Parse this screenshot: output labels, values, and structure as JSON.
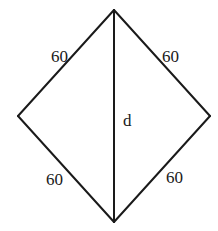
{
  "diagram": {
    "type": "rhombus",
    "stroke_color": "#1a1a1a",
    "background": "#ffffff",
    "vertices": {
      "top": [
        114,
        10
      ],
      "left": [
        18,
        116
      ],
      "right": [
        210,
        116
      ],
      "bottom": [
        114,
        222
      ]
    },
    "diagonal": {
      "label": "d",
      "from": "top",
      "to": "bottom"
    },
    "sides": [
      {
        "id": "top-left",
        "label": "60"
      },
      {
        "id": "top-right",
        "label": "60"
      },
      {
        "id": "bottom-left",
        "label": "60"
      },
      {
        "id": "bottom-right",
        "label": "60"
      }
    ]
  }
}
